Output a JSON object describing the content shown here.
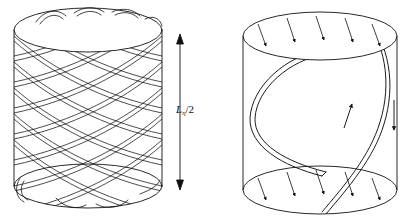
{
  "figure": {
    "ink_color": "#111111",
    "background": "#ffffff"
  },
  "panels": [
    {
      "id": "left",
      "name": "braided-helix-cylinder",
      "caption": "",
      "dimension_label": "L",
      "dimension_subscript": "η",
      "dimension_suffix": "/2",
      "dimension_full": "Lη/2",
      "arrow": {
        "type": "double-headed-vertical",
        "x": 180,
        "y_top": 38,
        "y_bottom": 186
      },
      "cylinder": {
        "cx": 88,
        "top_cy": 30,
        "bottom_cy": 186,
        "rx": 74,
        "ry": 22
      },
      "weave": {
        "strands_right_handed": 7,
        "strands_left_handed": 7,
        "style": "double-line-ribbon"
      }
    },
    {
      "id": "right",
      "name": "double-helix-field-cylinder",
      "cylinder": {
        "cx": 320,
        "top_cy": 36,
        "bottom_cy": 190,
        "rx": 77,
        "ry": 24
      },
      "labels": {
        "current_top": "i",
        "current_top_sub": "θ",
        "current_bottom": "i",
        "current_bottom_sub": "θ",
        "magnetic_field": "B",
        "electric_field_left": "E",
        "electric_field_right": "E",
        "current_axial_left": "i",
        "current_axial_left_sub": "z",
        "current_axial_right": "i",
        "current_axial_right_sub": "z"
      },
      "vectors": {
        "B_direction": "up",
        "E_left_direction": "down",
        "E_right_direction": "up",
        "endcap_arrow_count_top": 6,
        "endcap_arrow_count_bottom": 5,
        "endcap_arrow_direction": "down-right-slanted"
      },
      "helix": {
        "strand_count": 2,
        "turns": 1.5,
        "style": "thick-double-line-ribbon"
      }
    }
  ]
}
